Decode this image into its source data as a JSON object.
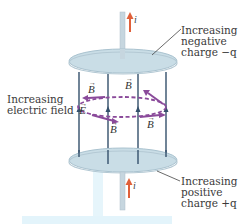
{
  "diagram": {
    "current_symbol": "i",
    "field_symbol_B": "B",
    "field_symbol_E": "E",
    "vector_arrow": "→",
    "labels": {
      "top_plate": [
        "Increasing",
        "negative",
        "charge −q"
      ],
      "bottom_plate": [
        "Increasing",
        "positive",
        "charge +q"
      ],
      "electric_field": [
        "Increasing",
        "electric field"
      ]
    },
    "b_labels_count": 4,
    "e_field_lines_count": 4
  },
  "colors": {
    "plate_fill": "#c9dde6",
    "plate_edge": "#a9c2cf",
    "wire": "#c6d6df",
    "current_arrow": "#e0603a",
    "field_line": "#34506b",
    "b_loop": "#8a4a9a",
    "leader_line": "#444444",
    "highlight_band": "#e3f4fb"
  }
}
